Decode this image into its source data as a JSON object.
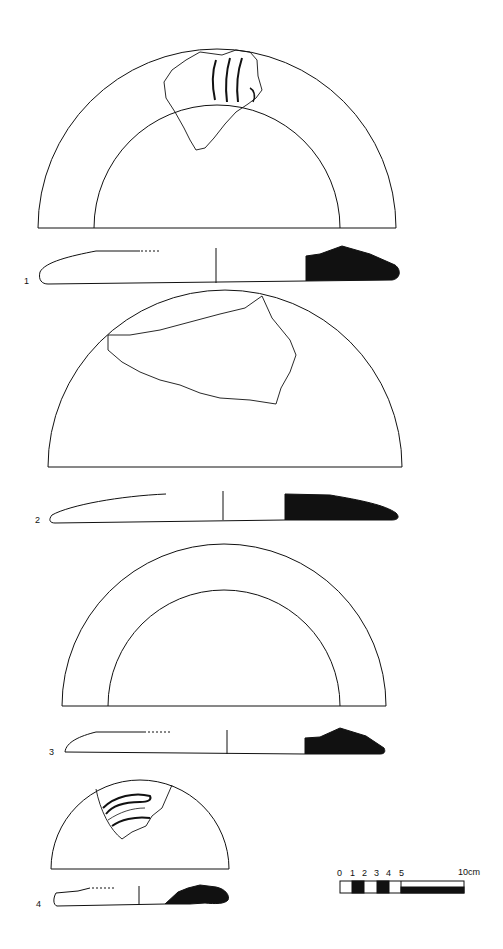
{
  "plate": {
    "background": "#ffffff",
    "ink": "#111111",
    "figures": [
      {
        "number": "1",
        "label": "1",
        "type": "plan-and-section",
        "plan": "half-ring with inner circle, rim sherd with grooves"
      },
      {
        "number": "2",
        "label": "2",
        "type": "plan-and-section",
        "plan": "half-disc with sherd outline"
      },
      {
        "number": "3",
        "label": "3",
        "type": "plan-and-section",
        "plan": "half-ring with inner circle"
      },
      {
        "number": "4",
        "label": "4",
        "type": "plan-and-section",
        "plan": "small half-disc with grooved sherd"
      }
    ]
  },
  "scale_bar": {
    "ticks": [
      "0",
      "1",
      "2",
      "3",
      "4",
      "5"
    ],
    "end_label": "10cm",
    "unit": "cm"
  }
}
